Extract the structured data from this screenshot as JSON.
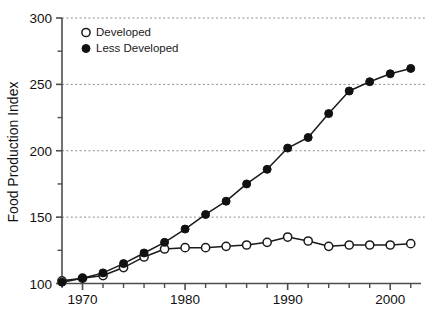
{
  "chart_data": {
    "type": "line",
    "title": "",
    "subtitle": "",
    "xlabel": "",
    "ylabel": "Food Production Index",
    "xlim": [
      1968,
      2003
    ],
    "ylim": [
      100,
      300
    ],
    "grid": true,
    "grid_style": "dotted-horizontal",
    "legend_position": "top-left-inside",
    "x_major_ticks": [
      1970,
      1980,
      1990,
      2000
    ],
    "x_major_tick_labels": [
      "1970",
      "1980",
      "1990",
      "2000"
    ],
    "x_minor_tick_step": 2,
    "y_major_ticks": [
      100,
      150,
      200,
      250,
      300
    ],
    "y_major_tick_labels": [
      "100",
      "150",
      "200",
      "250",
      "300"
    ],
    "y_minor_ticks": [
      125,
      175,
      225,
      275
    ],
    "x": [
      1968,
      1970,
      1972,
      1974,
      1976,
      1978,
      1980,
      1982,
      1984,
      1986,
      1988,
      1990,
      1992,
      1994,
      1996,
      1998,
      2000,
      2002
    ],
    "series": [
      {
        "name": "Developed",
        "marker": "open-circle",
        "marker_fill": "#ffffff",
        "marker_edge": "#1a1a1a",
        "line_color": "#1a1a1a",
        "values": [
          102,
          104,
          106,
          112,
          120,
          126,
          127,
          127,
          128,
          129,
          131,
          135,
          132,
          128,
          129,
          129,
          129,
          130
        ]
      },
      {
        "name": "Less Developed",
        "marker": "filled-circle",
        "marker_fill": "#111111",
        "marker_edge": "#111111",
        "line_color": "#1a1a1a",
        "values": [
          101,
          104,
          108,
          115,
          123,
          131,
          141,
          152,
          162,
          175,
          186,
          202,
          210,
          228,
          245,
          252,
          258,
          262
        ]
      }
    ]
  },
  "legend": {
    "items": [
      {
        "label": "Developed",
        "marker": "open-circle"
      },
      {
        "label": "Less Developed",
        "marker": "filled-circle"
      }
    ]
  },
  "colors": {
    "axis": "#4d4d4d",
    "grid": "#8c8c8c",
    "line": "#1a1a1a",
    "marker_open_fill": "#ffffff",
    "marker_filled_fill": "#111111",
    "text": "#111111",
    "background": "#ffffff"
  }
}
